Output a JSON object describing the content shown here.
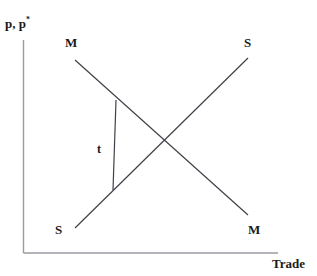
{
  "figure": {
    "title_fragment": "",
    "background_color": "#ffffff",
    "line_color": "#404048",
    "axis_color": "#9a9aa2",
    "text_color": "#1a1a1a"
  },
  "axes": {
    "y_label_main": "p, p",
    "y_label_superscript": "*",
    "x_label": "Trade"
  },
  "curves": {
    "import_demand_top_label": "M",
    "import_demand_bottom_label": "M",
    "export_supply_top_label": "S",
    "export_supply_bottom_label": "S"
  },
  "annotations": {
    "tariff_label": "t"
  },
  "chart_data": {
    "type": "line",
    "title": "",
    "xlabel": "Trade",
    "ylabel": "p, p*",
    "xlim": [
      0,
      317
    ],
    "ylim": [
      276,
      0
    ],
    "grid": false,
    "legend": "none",
    "axis_lines": {
      "y_axis": {
        "x": 23.5,
        "y_top": 40,
        "y_bottom": 253
      },
      "x_axis": {
        "y": 253,
        "x_left": 23.5,
        "x_right": 278
      }
    },
    "series": [
      {
        "name": "M",
        "label": "M",
        "description": "downward sloping import demand curve",
        "points": [
          [
            75,
            60
          ],
          [
            248,
            215
          ]
        ]
      },
      {
        "name": "S",
        "label": "S",
        "description": "upward sloping export supply curve",
        "points": [
          [
            75,
            228
          ],
          [
            248,
            58
          ]
        ]
      },
      {
        "name": "t",
        "label": "t",
        "description": "vertical tariff wedge between M and S curves",
        "points": [
          [
            116,
            100
          ],
          [
            113,
            190
          ]
        ]
      }
    ],
    "annotations": [
      {
        "text": "M",
        "x": 72,
        "y": 44,
        "role": "curve-label-top-left"
      },
      {
        "text": "S",
        "x": 249,
        "y": 44,
        "role": "curve-label-top-right"
      },
      {
        "text": "S",
        "x": 60,
        "y": 231,
        "role": "curve-label-bottom-left"
      },
      {
        "text": "M",
        "x": 253,
        "y": 231,
        "role": "curve-label-bottom-right"
      },
      {
        "text": "t",
        "x": 100,
        "y": 150,
        "role": "tariff-wedge-label"
      },
      {
        "text": "p, p*",
        "x": 5,
        "y": 27,
        "role": "y-axis-label"
      },
      {
        "text": "Trade",
        "x": 275,
        "y": 265,
        "role": "x-axis-label"
      }
    ],
    "intersection": {
      "x": 162,
      "y": 143
    }
  }
}
